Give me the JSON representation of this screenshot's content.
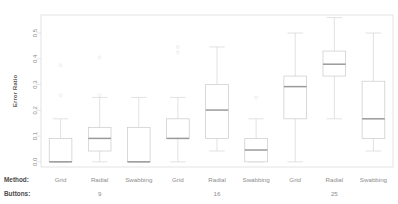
{
  "chart_data": {
    "type": "box",
    "title": "",
    "xlabel": "",
    "ylabel": "Error Ratio",
    "ylim": [
      -0.02,
      0.57
    ],
    "yticks": [
      0.0,
      0.1,
      0.2,
      0.3,
      0.4,
      0.5
    ],
    "ytick_labels": [
      "0.0",
      "0.1",
      "0.2",
      "0.3",
      "0.4",
      "0.5"
    ],
    "grid": false,
    "legend": "none",
    "strip_labels": {
      "method_header": "Method:",
      "buttons_header": "Buttons:"
    },
    "group_labels": [
      "9",
      "16",
      "25"
    ],
    "categories": [
      "Grid",
      "Radial",
      "Swabbing",
      "Grid",
      "Radial",
      "Swabbing",
      "Grid",
      "Radial",
      "Swabbing"
    ],
    "boxes": [
      {
        "method": "Grid",
        "buttons": "9",
        "min": 0.0,
        "q1": 0.0,
        "median": 0.0,
        "q3": 0.091,
        "max": 0.167,
        "outliers": [
          0.375,
          0.258
        ]
      },
      {
        "method": "Radial",
        "buttons": "9",
        "min": 0.0,
        "q1": 0.042,
        "median": 0.091,
        "q3": 0.134,
        "max": 0.25,
        "outliers": [
          0.405,
          0.258
        ]
      },
      {
        "method": "Swabbing",
        "buttons": "9",
        "min": 0.0,
        "q1": 0.0,
        "median": 0.0,
        "q3": 0.134,
        "max": 0.25,
        "outliers": []
      },
      {
        "method": "Grid",
        "buttons": "16",
        "min": 0.0,
        "q1": 0.091,
        "median": 0.091,
        "q3": 0.167,
        "max": 0.25,
        "outliers": [
          0.446,
          0.425
        ]
      },
      {
        "method": "Radial",
        "buttons": "16",
        "min": 0.042,
        "q1": 0.091,
        "median": 0.201,
        "q3": 0.3,
        "max": 0.446,
        "outliers": []
      },
      {
        "method": "Swabbing",
        "buttons": "16",
        "min": 0.0,
        "q1": 0.0,
        "median": 0.046,
        "q3": 0.091,
        "max": 0.167,
        "outliers": [
          0.25
        ]
      },
      {
        "method": "Grid",
        "buttons": "25",
        "min": 0.0,
        "q1": 0.167,
        "median": 0.292,
        "q3": 0.333,
        "max": 0.5,
        "outliers": []
      },
      {
        "method": "Radial",
        "buttons": "25",
        "min": 0.167,
        "q1": 0.333,
        "median": 0.379,
        "q3": 0.43,
        "max": 0.56,
        "outliers": []
      },
      {
        "method": "Swabbing",
        "buttons": "25",
        "min": 0.042,
        "q1": 0.091,
        "median": 0.167,
        "q3": 0.313,
        "max": 0.5,
        "outliers": []
      }
    ]
  }
}
